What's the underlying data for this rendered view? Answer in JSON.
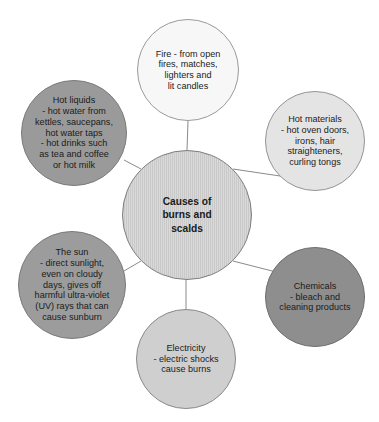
{
  "diagram": {
    "title": "Causes of burns and scalds",
    "type": "radial-hub-and-spoke",
    "center": {
      "id": "center",
      "label": "Causes of\nburns and\nscalds",
      "fill": "#c9c9c9",
      "cx": 187,
      "cy": 215,
      "r": 65
    },
    "nodes": [
      {
        "id": "fire",
        "label": "Fire - from open\nfires, matches,\nlighters and\nlit candles",
        "fill": "#f7f7f7",
        "cx": 188,
        "cy": 70,
        "r": 51
      },
      {
        "id": "hot-materials",
        "label": "Hot materials\n- hot oven doors,\nirons, hair\nstraighteners,\ncurling tongs",
        "fill": "#e4e4e4",
        "cx": 315,
        "cy": 141,
        "r": 50
      },
      {
        "id": "chemicals",
        "label": "Chemicals\n- bleach and\ncleaning products",
        "fill": "#8e8e8e",
        "cx": 315,
        "cy": 297,
        "r": 50
      },
      {
        "id": "electricity",
        "label": "Electricity\n- electric shocks\ncause burns",
        "fill": "#cfcfcf",
        "cx": 186,
        "cy": 359,
        "r": 50
      },
      {
        "id": "the-sun",
        "label": "The sun\n- direct sunlight,\neven on cloudy\ndays, gives off\nharmful ultra-violet\n(UV) rays that can\ncause sunburn",
        "fill": "#9c9c9c",
        "cx": 72,
        "cy": 285,
        "r": 54
      },
      {
        "id": "hot-liquids",
        "label": "Hot liquids\n- hot water from\nkettles, saucepans,\nhot water taps\n- hot drinks such\nas tea and coffee\nor hot milk",
        "fill": "#9a9a9a",
        "cx": 74,
        "cy": 133,
        "r": 53
      }
    ],
    "connector_color": "#8a8a8a"
  }
}
